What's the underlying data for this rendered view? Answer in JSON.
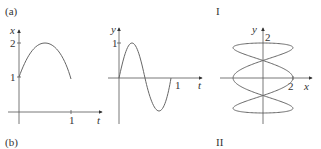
{
  "labels": {
    "panel_a": "(a)",
    "panel_b": "(b)",
    "roman_1": "I",
    "roman_2": "II"
  },
  "chart_data": [
    {
      "type": "line",
      "title": "",
      "xlabel": "t",
      "ylabel": "x",
      "xticks": [
        "1"
      ],
      "yticks": [
        "1",
        "2"
      ],
      "x": [
        0,
        0.25,
        0.5,
        0.75,
        1
      ],
      "values": [
        1,
        1.7,
        2,
        1.7,
        0.95
      ],
      "description": "x(t) rises from 1 at t=0 to max 2 at t=0.5, back to ~1 at t=1",
      "grid": false
    },
    {
      "type": "line",
      "title": "",
      "xlabel": "t",
      "ylabel": "y",
      "xticks": [
        "1"
      ],
      "yticks": [
        "1"
      ],
      "x": [
        0,
        0.25,
        0.5,
        0.75,
        1
      ],
      "values": [
        0,
        1,
        0,
        -1,
        0
      ],
      "description": "y(t) = sin(2πt), one full period over [0,1]",
      "grid": false
    },
    {
      "type": "line",
      "title": "",
      "xlabel": "x",
      "ylabel": "y",
      "xticks": [
        "2"
      ],
      "yticks": [
        "2"
      ],
      "description": "Parametric Lissajous curve with x-amplitude 2 and y-amplitude 2, symmetric about both axes, passing through origin",
      "grid": false
    }
  ],
  "chart1": {
    "ylabel": "x",
    "xlabel": "t",
    "ytick_1": "1",
    "ytick_2": "2",
    "xtick_1": "1"
  },
  "chart2": {
    "ylabel": "y",
    "xlabel": "t",
    "ytick_1": "1",
    "xtick_1": "1"
  },
  "chart3": {
    "ylabel": "y",
    "xlabel": "x",
    "ytick_2": "2",
    "xtick_2": "2"
  }
}
